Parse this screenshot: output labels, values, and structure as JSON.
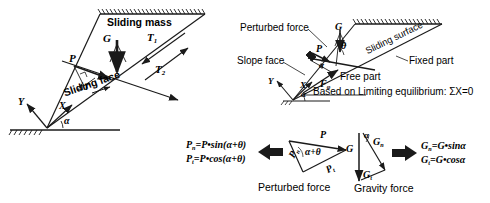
{
  "figure": {
    "ink_color": "#1a1a1a",
    "bg_color": "#ffffff"
  },
  "left_diagram": {
    "name": "sliding mass free body diagram",
    "labels": {
      "sliding_mass": "Sliding mass",
      "sliding_face": "Sliding face",
      "gravity": "G",
      "perturbed": "P",
      "delta_t": "ΔT",
      "t1": "T",
      "t1_sub": "1",
      "t2": "T",
      "t2_sub": "2",
      "axis_x": "X",
      "axis_y": "Y",
      "alpha": "α"
    }
  },
  "right_diagram": {
    "name": "limiting equilibrium diagram",
    "labels": {
      "perturbed_force": "Perturbed force",
      "slope_face": "Slope face",
      "sliding_surface": "Sliding surface",
      "fixed_part": "Fixed part",
      "free_part": "Free part",
      "gravity": "G",
      "perturbed": "P",
      "theta": "θ",
      "alpha_inner": "α",
      "f_phi": "F",
      "f_phi_sub": "φ",
      "axis_x": "X",
      "axis_y": "Y",
      "alpha": "α",
      "equilibrium_note": "Based on Limiting equilibrium: ΣX=0"
    }
  },
  "perturbed_force_block": {
    "caption": "Perturbed force",
    "equation_1_lhs": "P",
    "equation_1_lhs_sub": "n",
    "equation_1_rhs": "=P•sin(α+θ)",
    "equation_2_lhs": "P",
    "equation_2_lhs_sub": "t",
    "equation_2_rhs": "=P•cos(α+θ)",
    "triangle": {
      "resultant": "P",
      "normal": "P",
      "normal_sub": "n",
      "tangential": "P",
      "tangential_sub": "t",
      "angle": "α+θ"
    }
  },
  "gravity_force_block": {
    "caption": "Gravity force",
    "equation_1_lhs": "G",
    "equation_1_lhs_sub": "n",
    "equation_1_rhs": "=G•sinα",
    "equation_2_lhs": "G",
    "equation_2_lhs_sub": "t",
    "equation_2_rhs": "=G•cosα",
    "triangle": {
      "resultant": "G",
      "normal": "G",
      "normal_sub": "n",
      "tangential": "G",
      "tangential_sub": "t",
      "angle": "α"
    }
  }
}
